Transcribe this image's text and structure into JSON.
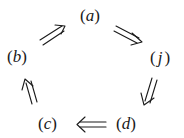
{
  "diagram": {
    "type": "cycle",
    "nodes": [
      {
        "id": "a",
        "label": "a",
        "x": 92,
        "y": 17
      },
      {
        "id": "b",
        "label": "b",
        "x": 19,
        "y": 58
      },
      {
        "id": "j",
        "label": "j",
        "x": 160,
        "y": 59
      },
      {
        "id": "c",
        "label": "c",
        "x": 50,
        "y": 125
      },
      {
        "id": "d",
        "label": "d",
        "x": 128,
        "y": 125
      }
    ],
    "edges": [
      {
        "from": "a",
        "to": "j",
        "style": "double-arrow"
      },
      {
        "from": "j",
        "to": "d",
        "style": "double-arrow"
      },
      {
        "from": "d",
        "to": "c",
        "style": "double-arrow"
      },
      {
        "from": "c",
        "to": "b",
        "style": "double-arrow"
      },
      {
        "from": "b",
        "to": "a",
        "style": "double-arrow"
      }
    ],
    "paren_open": "(",
    "paren_close": ")",
    "ink_color": "#1a1a1a"
  }
}
